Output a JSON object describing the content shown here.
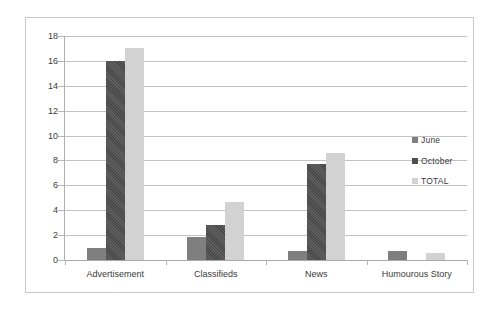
{
  "chart_data": {
    "type": "bar",
    "title": "",
    "subtitle": "",
    "xlabel": "",
    "ylabel": "",
    "ylim": [
      0,
      18
    ],
    "ytick_step": 2,
    "yticks": [
      "18",
      "16",
      "14",
      "12",
      "10",
      "8",
      "6",
      "4",
      "2",
      "0"
    ],
    "grid": true,
    "legend_position": "right",
    "categories": [
      "Advertisement",
      "Classifieds",
      "News",
      "Humourous Story"
    ],
    "series": [
      {
        "name": "June",
        "color": "#7f7f7f",
        "values": [
          0.95,
          1.85,
          0.7,
          0.7
        ]
      },
      {
        "name": "October",
        "color": "#4f4f4f",
        "values": [
          16.0,
          2.8,
          7.7,
          0
        ]
      },
      {
        "name": "TOTAL",
        "color": "#d2d2d2",
        "values": [
          17.0,
          4.7,
          8.6,
          0.6
        ]
      }
    ]
  },
  "legend": {
    "items": [
      {
        "label": "June"
      },
      {
        "label": "October"
      },
      {
        "label": "TOTAL"
      }
    ]
  },
  "colors": {
    "series_june": "#7f7f7f",
    "series_october": "#4f4f4f",
    "series_total": "#d2d2d2",
    "gridline": "#c2c2c2",
    "axis": "#b0b0b0",
    "border": "#c9c9c9",
    "text": "#3a3a3a",
    "background": "#ffffff"
  }
}
